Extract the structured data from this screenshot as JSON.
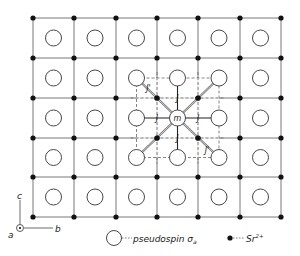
{
  "diagram": {
    "type": "crystal-lattice",
    "grid": {
      "columns": 6,
      "rows": 5,
      "sr_x": [
        33,
        74,
        116,
        157,
        198,
        240,
        281
      ],
      "sr_y": [
        18,
        58,
        98,
        138,
        177,
        217
      ],
      "cell_line_color": "#555555",
      "sr_color": "#111111",
      "pseudospin_radius": 8
    },
    "highlight": {
      "center_col": 3,
      "center_row": 2,
      "center_label": "m",
      "nearest_label": "J",
      "diagonal_label": "J'",
      "dashed_box_color": "#666666",
      "diagonal_bond_color": "#777777"
    },
    "axes": {
      "c_label": "c",
      "b_label": "b",
      "a_label": "a"
    },
    "legend": {
      "pseudospin_text": "pseudospin",
      "pseudospin_symbol": "σ",
      "pseudospin_subscript": "a",
      "sr_text": "Sr",
      "sr_superscript": "2+"
    }
  }
}
